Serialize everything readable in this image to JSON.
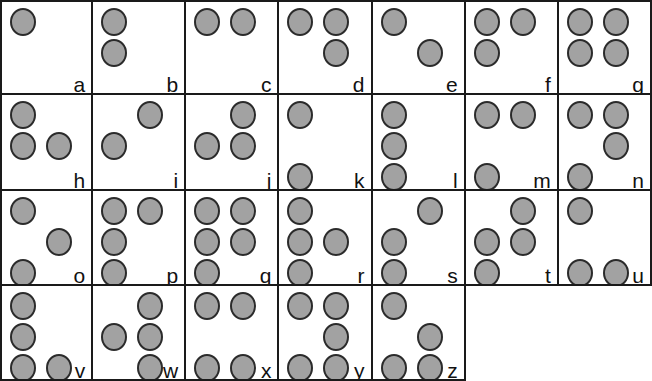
{
  "chart": {
    "type": "braille-grid",
    "columns": 7,
    "rows": 4,
    "dot_positions_legend": {
      "1": "top-left",
      "2": "middle-left",
      "3": "bottom-left",
      "4": "top-right",
      "5": "middle-right",
      "6": "bottom-right"
    },
    "colors": {
      "dot_fill": "#a2a2a2",
      "dot_stroke": "#2b2b2b",
      "grid_line": "#1a1a1a",
      "background": "#ffffff",
      "label_text": "#111111"
    }
  },
  "cells": [
    {
      "label": "a",
      "dots": [
        1
      ]
    },
    {
      "label": "b",
      "dots": [
        1,
        2
      ]
    },
    {
      "label": "c",
      "dots": [
        1,
        4
      ]
    },
    {
      "label": "d",
      "dots": [
        1,
        4,
        5
      ]
    },
    {
      "label": "e",
      "dots": [
        1,
        5
      ]
    },
    {
      "label": "f",
      "dots": [
        1,
        2,
        4
      ]
    },
    {
      "label": "g",
      "dots": [
        1,
        2,
        4,
        5
      ]
    },
    {
      "label": "h",
      "dots": [
        1,
        2,
        5
      ]
    },
    {
      "label": "i",
      "dots": [
        2,
        4
      ]
    },
    {
      "label": "j",
      "dots": [
        2,
        4,
        5
      ]
    },
    {
      "label": "k",
      "dots": [
        1,
        3
      ]
    },
    {
      "label": "l",
      "dots": [
        1,
        2,
        3
      ]
    },
    {
      "label": "m",
      "dots": [
        1,
        3,
        4
      ]
    },
    {
      "label": "n",
      "dots": [
        1,
        3,
        4,
        5
      ]
    },
    {
      "label": "o",
      "dots": [
        1,
        3,
        5
      ]
    },
    {
      "label": "p",
      "dots": [
        1,
        2,
        3,
        4
      ]
    },
    {
      "label": "q",
      "dots": [
        1,
        2,
        3,
        4,
        5
      ]
    },
    {
      "label": "r",
      "dots": [
        1,
        2,
        3,
        5
      ]
    },
    {
      "label": "s",
      "dots": [
        2,
        3,
        4
      ]
    },
    {
      "label": "t",
      "dots": [
        2,
        3,
        4,
        5
      ]
    },
    {
      "label": "u",
      "dots": [
        1,
        3,
        6
      ]
    },
    {
      "label": "v",
      "dots": [
        1,
        2,
        3,
        6
      ]
    },
    {
      "label": "w",
      "dots": [
        2,
        4,
        5,
        6
      ]
    },
    {
      "label": "x",
      "dots": [
        1,
        3,
        4,
        6
      ]
    },
    {
      "label": "y",
      "dots": [
        1,
        3,
        4,
        5,
        6
      ]
    },
    {
      "label": "z",
      "dots": [
        1,
        3,
        5,
        6
      ]
    },
    {
      "label": "",
      "dots": [],
      "empty": true
    },
    {
      "label": "",
      "dots": [],
      "empty": true
    }
  ]
}
